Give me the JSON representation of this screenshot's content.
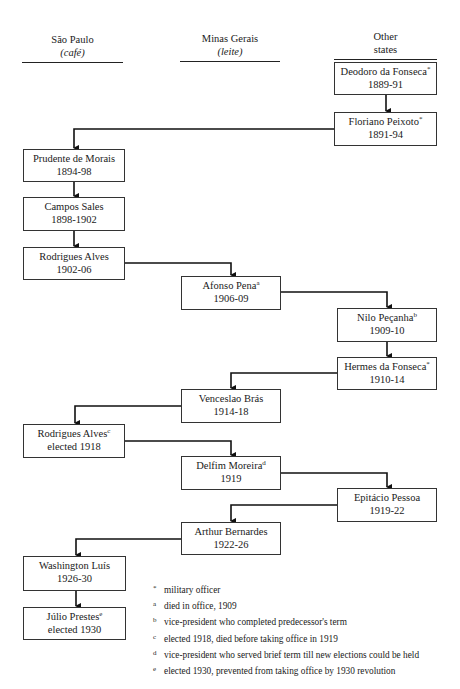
{
  "columns": [
    {
      "id": "sao-paulo",
      "title": "São Paulo",
      "subtitle": "(café)"
    },
    {
      "id": "minas-gerais",
      "title": "Minas Gerais",
      "subtitle": "(leite)"
    },
    {
      "id": "other-states",
      "title": "Other",
      "subtitle": "states"
    }
  ],
  "presidents": [
    {
      "name": "Deodoro da Fonseca",
      "mark": "*",
      "term": "1889-91",
      "column": "other-states"
    },
    {
      "name": "Floriano Peixoto",
      "mark": "*",
      "term": "1891-94",
      "column": "other-states"
    },
    {
      "name": "Prudente de Morais",
      "mark": "",
      "term": "1894-98",
      "column": "sao-paulo"
    },
    {
      "name": "Campos Sales",
      "mark": "",
      "term": "1898-1902",
      "column": "sao-paulo"
    },
    {
      "name": "Rodrigues Alves",
      "mark": "",
      "term": "1902-06",
      "column": "sao-paulo"
    },
    {
      "name": "Afonso Pena",
      "mark": "a",
      "term": "1906-09",
      "column": "minas-gerais"
    },
    {
      "name": "Nilo Peçanha",
      "mark": "b",
      "term": "1909-10",
      "column": "other-states"
    },
    {
      "name": "Hermes da Fonseca",
      "mark": "*",
      "term": "1910-14",
      "column": "other-states"
    },
    {
      "name": "Venceslao Brás",
      "mark": "",
      "term": "1914-18",
      "column": "minas-gerais"
    },
    {
      "name": "Rodrigues Alves",
      "mark": "c",
      "term": "elected 1918",
      "column": "sao-paulo"
    },
    {
      "name": "Delfim Moreira",
      "mark": "d",
      "term": "1919",
      "column": "minas-gerais"
    },
    {
      "name": "Epitácio Pessoa",
      "mark": "",
      "term": "1919-22",
      "column": "other-states"
    },
    {
      "name": "Arthur Bernardes",
      "mark": "",
      "term": "1922-26",
      "column": "minas-gerais"
    },
    {
      "name": "Washington Luís",
      "mark": "",
      "term": "1926-30",
      "column": "sao-paulo"
    },
    {
      "name": "Júlio Prestes",
      "mark": "e",
      "term": "elected 1930",
      "column": "sao-paulo"
    }
  ],
  "footnotes": [
    {
      "mark": "*",
      "text": "military officer"
    },
    {
      "mark": "a",
      "text": "died in office, 1909"
    },
    {
      "mark": "b",
      "text": "vice-president who completed predecessor's term"
    },
    {
      "mark": "c",
      "text": "elected 1918, died before taking office in 1919"
    },
    {
      "mark": "d",
      "text": "vice-president who served brief term till new elections could be held"
    },
    {
      "mark": "e",
      "text": "elected 1930, prevented from taking office by 1930 revolution"
    }
  ]
}
